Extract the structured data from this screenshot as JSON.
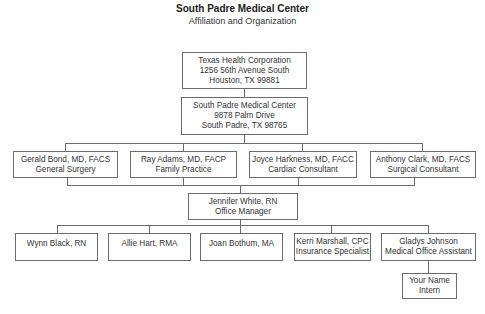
{
  "header": {
    "title": "South Padre Medical Center",
    "subtitle": "Affiliation and Organization"
  },
  "org_chart": {
    "parent": {
      "name": "Texas Health Corporation",
      "address": "1256 56th Avenue South",
      "city": "Houston, TX 99881"
    },
    "center": {
      "name": "South Padre Medical Center",
      "address": "9878 Palm Drive",
      "city": "South Padre, TX 98765"
    },
    "physicians": [
      {
        "name": "Gerald Bond, MD, FACS",
        "role": "General Surgery"
      },
      {
        "name": "Ray Adams, MD, FACP",
        "role": "Family Practice"
      },
      {
        "name": "Joyce Harkness, MD, FACC",
        "role": "Cardiac Consultant"
      },
      {
        "name": "Anthony Clark, MD, FACS",
        "role": "Surgical Consultant"
      }
    ],
    "manager": {
      "name": "Jennifer White, RN",
      "role": "Office Manager"
    },
    "staff": [
      {
        "name": "Wynn Black, RN",
        "role": ""
      },
      {
        "name": "Allie Hart, RMA",
        "role": ""
      },
      {
        "name": "Joan Bothum, MA",
        "role": ""
      },
      {
        "name": "Kerri Marshall, CPC",
        "role": "Insurance Specialist"
      },
      {
        "name": "Gladys Johnson",
        "role": "Medical Office Assistant"
      }
    ],
    "intern": {
      "name": "Your Name",
      "role": "Intern"
    }
  }
}
